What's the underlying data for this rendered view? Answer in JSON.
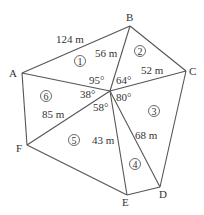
{
  "diagram": {
    "type": "polygon-triangulation",
    "colors": {
      "line": "#555555",
      "text": "#333333",
      "background": "#ffffff"
    },
    "center": {
      "x": 110,
      "y": 91
    },
    "vertices": [
      {
        "id": "A",
        "label": "A",
        "x": 22,
        "y": 73,
        "lx": 9,
        "ly": 77
      },
      {
        "id": "B",
        "label": "B",
        "x": 130,
        "y": 26,
        "lx": 126,
        "ly": 21
      },
      {
        "id": "C",
        "label": "C",
        "x": 186,
        "y": 71,
        "lx": 189,
        "ly": 75
      },
      {
        "id": "D",
        "label": "D",
        "x": 160,
        "y": 187,
        "lx": 159,
        "ly": 198
      },
      {
        "id": "E",
        "label": "E",
        "x": 127,
        "y": 195,
        "lx": 122,
        "ly": 206
      },
      {
        "id": "F",
        "label": "F",
        "x": 27,
        "y": 145,
        "lx": 16,
        "ly": 152
      }
    ],
    "outer_edges": [
      [
        "A",
        "B"
      ],
      [
        "B",
        "C"
      ],
      [
        "C",
        "D"
      ],
      [
        "D",
        "E"
      ],
      [
        "E",
        "F"
      ],
      [
        "F",
        "A"
      ]
    ],
    "spokes": [
      "A",
      "B",
      "C",
      "D",
      "E",
      "F"
    ],
    "distance_labels": [
      {
        "text": "124 m",
        "x": 56,
        "y": 43,
        "edge": "A-B"
      },
      {
        "text": "56 m",
        "x": 95,
        "y": 57,
        "edge": "center-B"
      },
      {
        "text": "52 m",
        "x": 141,
        "y": 74,
        "edge": "center-C"
      },
      {
        "text": "85 m",
        "x": 42,
        "y": 118,
        "edge": "center-F"
      },
      {
        "text": "43 m",
        "x": 92,
        "y": 144,
        "edge": "center-E"
      },
      {
        "text": "68 m",
        "x": 135,
        "y": 139,
        "edge": "center-D"
      }
    ],
    "angle_labels": [
      {
        "text": "95°",
        "x": 89,
        "y": 84
      },
      {
        "text": "64°",
        "x": 116,
        "y": 84
      },
      {
        "text": "38°",
        "x": 80,
        "y": 98
      },
      {
        "text": "80°",
        "x": 116,
        "y": 101
      },
      {
        "text": "58°",
        "x": 93,
        "y": 111
      }
    ],
    "region_labels": [
      {
        "text": "1",
        "x": 80,
        "y": 61
      },
      {
        "text": "2",
        "x": 140,
        "y": 51
      },
      {
        "text": "3",
        "x": 154,
        "y": 111
      },
      {
        "text": "4",
        "x": 135,
        "y": 164
      },
      {
        "text": "5",
        "x": 74,
        "y": 140
      },
      {
        "text": "6",
        "x": 46,
        "y": 96
      }
    ]
  }
}
